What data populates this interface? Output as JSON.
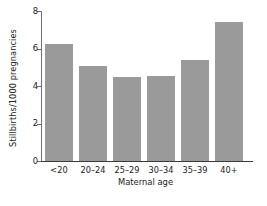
{
  "chart_data": {
    "type": "bar",
    "title": "",
    "categories": [
      "<20",
      "20–24",
      "25–29",
      "30–34",
      "35–39",
      "40+"
    ],
    "values": [
      6.25,
      5.05,
      4.5,
      4.55,
      5.4,
      7.4
    ],
    "series": [
      {
        "name": "Stillbirths per 1000 pregnancies",
        "values": [
          6.25,
          5.05,
          4.5,
          4.55,
          5.4,
          7.4
        ]
      }
    ],
    "xlabel": "Maternal age",
    "ylabel": "Stillbirths/1000 pregnancies",
    "ylim": [
      0,
      8
    ],
    "yticks": [
      0,
      2,
      4,
      6,
      8
    ],
    "ytick_labels": [
      "0",
      "2",
      "4",
      "6",
      "8"
    ],
    "grid": false,
    "legend": false,
    "bar_color": "#9a9a9a",
    "axis_color": "#3b3b3b",
    "background_color": "#ffffff"
  },
  "axes": {
    "y_title": "Stillbirths/1000 pregnancies",
    "x_title": "Maternal age",
    "y_tick_0": "0",
    "y_tick_1": "2",
    "y_tick_2": "4",
    "y_tick_3": "6",
    "y_tick_4": "8",
    "x_tick_0": "<20",
    "x_tick_1": "20–24",
    "x_tick_2": "25–29",
    "x_tick_3": "30–34",
    "x_tick_4": "35–39",
    "x_tick_5": "40+"
  }
}
